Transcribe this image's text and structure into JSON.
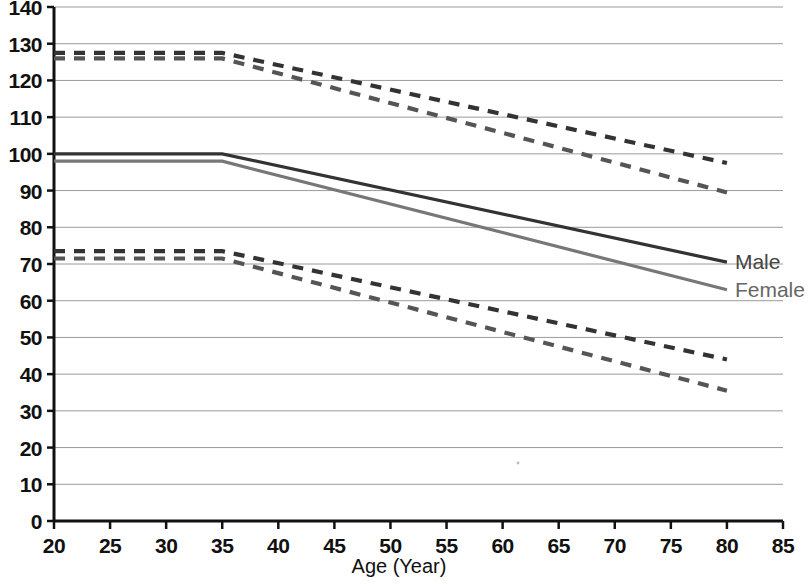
{
  "chart_data": {
    "type": "line",
    "title": "",
    "xlabel": "Age (Year)",
    "ylabel": "",
    "xlim": [
      20,
      85
    ],
    "ylim": [
      0,
      140
    ],
    "xticks": [
      20,
      25,
      30,
      35,
      40,
      45,
      50,
      55,
      60,
      65,
      70,
      75,
      80,
      85
    ],
    "yticks": [
      0,
      10,
      20,
      30,
      40,
      50,
      60,
      70,
      80,
      90,
      100,
      110,
      120,
      130,
      140
    ],
    "grid": "horizontal",
    "legend_position": "right-inline",
    "x": [
      20,
      35,
      80
    ],
    "series": [
      {
        "name": "Male upper limit",
        "group": "Male",
        "style": "dashed",
        "color": "#333333",
        "values": [
          127.5,
          127.5,
          97.5
        ],
        "label": ""
      },
      {
        "name": "Female upper limit",
        "group": "Female",
        "style": "dashed",
        "color": "#555555",
        "values": [
          126.0,
          126.0,
          89.5
        ],
        "label": ""
      },
      {
        "name": "Male",
        "group": "Male",
        "style": "solid",
        "color": "#333333",
        "values": [
          100.0,
          100.0,
          70.5
        ],
        "label": "Male"
      },
      {
        "name": "Female",
        "group": "Female",
        "style": "solid",
        "color": "#777777",
        "values": [
          98.0,
          98.0,
          63.0
        ],
        "label": "Female"
      },
      {
        "name": "Male lower limit",
        "group": "Male",
        "style": "dashed",
        "color": "#333333",
        "values": [
          73.5,
          73.5,
          44.0
        ],
        "label": ""
      },
      {
        "name": "Female lower limit",
        "group": "Female",
        "style": "dashed",
        "color": "#555555",
        "values": [
          71.5,
          71.5,
          35.5
        ],
        "label": ""
      }
    ]
  },
  "axis": {
    "x_title": "Age (Year)",
    "x_tick_labels": [
      "20",
      "25",
      "30",
      "35",
      "40",
      "45",
      "50",
      "55",
      "60",
      "65",
      "70",
      "75",
      "80",
      "85"
    ],
    "y_tick_labels": [
      "140",
      "130",
      "120",
      "110",
      "100",
      "90",
      "80",
      "70",
      "60",
      "50",
      "40",
      "30",
      "20",
      "10",
      "0"
    ]
  },
  "legend": {
    "male_label": "Male",
    "female_label": "Female"
  },
  "colors": {
    "male": "#333333",
    "female": "#777777",
    "grid": "#9a9a9a",
    "axis": "#111111",
    "background": "#ffffff"
  }
}
